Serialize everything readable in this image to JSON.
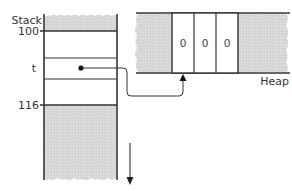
{
  "diagram": {
    "stack": {
      "title": "Stack",
      "top_address": "100",
      "bottom_address": "116",
      "variable_label": "t",
      "growth_direction": "down"
    },
    "heap": {
      "title": "Heap",
      "cells": [
        "0",
        "0",
        "0"
      ]
    },
    "pointer": {
      "from": "t",
      "to": "heap-array"
    },
    "colors": {
      "line": "#333333",
      "shade": "#d4d4d4",
      "background": "#ffffff"
    }
  }
}
